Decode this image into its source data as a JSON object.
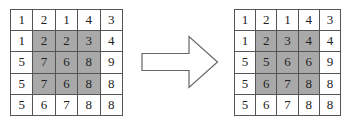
{
  "diagram": {
    "shade_color": "#a9a9a9",
    "line_color": "#555555",
    "before": {
      "rows": [
        [
          1,
          2,
          1,
          4,
          3
        ],
        [
          1,
          2,
          2,
          3,
          4
        ],
        [
          5,
          7,
          6,
          8,
          9
        ],
        [
          5,
          7,
          6,
          8,
          8
        ],
        [
          5,
          6,
          7,
          8,
          8
        ]
      ],
      "shaded_region": {
        "row_start": 1,
        "row_end": 3,
        "col_start": 1,
        "col_end": 3
      }
    },
    "arrow": {
      "direction": "right",
      "style": "outlined-block-arrow"
    },
    "after": {
      "rows": [
        [
          1,
          2,
          1,
          4,
          3
        ],
        [
          1,
          2,
          3,
          4,
          4
        ],
        [
          5,
          5,
          6,
          6,
          9
        ],
        [
          5,
          6,
          7,
          8,
          8
        ],
        [
          5,
          6,
          7,
          8,
          8
        ]
      ],
      "shaded_region": {
        "row_start": 1,
        "row_end": 3,
        "col_start": 1,
        "col_end": 3
      }
    }
  }
}
